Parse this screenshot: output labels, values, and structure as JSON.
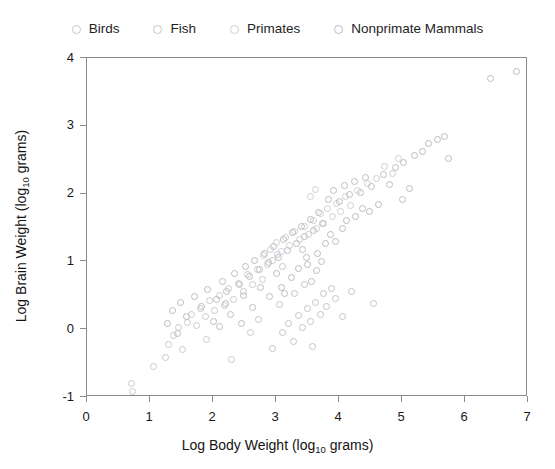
{
  "legend": {
    "position": "top",
    "items": [
      {
        "label": "Birds",
        "color": "#c9c9cf",
        "marker": "open-circle"
      },
      {
        "label": "Fish",
        "color": "#c4c4ca",
        "marker": "open-circle"
      },
      {
        "label": "Primates",
        "color": "#cfcfd5",
        "marker": "open-circle"
      },
      {
        "label": "Nonprimate Mammals",
        "color": "#bcbcc2",
        "marker": "open-circle"
      }
    ]
  },
  "axes": {
    "x": {
      "title_prefix": "Log Body Weight (log",
      "title_sub": "10",
      "title_suffix": " grams)",
      "ticks": [
        "0",
        "1",
        "2",
        "3",
        "4",
        "5",
        "6",
        "7"
      ]
    },
    "y": {
      "title_prefix": "Log Brain Weight (log",
      "title_sub": "10",
      "title_suffix": " grams)",
      "ticks": [
        "4",
        "3",
        "2",
        "1",
        "0",
        "-1"
      ]
    }
  },
  "chart_data": {
    "type": "scatter",
    "title": "",
    "xlabel": "Log Body Weight (log10 grams)",
    "ylabel": "Log Brain Weight (log10 grams)",
    "xlim": [
      0,
      7
    ],
    "ylim": [
      -1,
      4
    ],
    "xticks": [
      0,
      1,
      2,
      3,
      4,
      5,
      6,
      7
    ],
    "yticks": [
      -1,
      0,
      1,
      2,
      3,
      4
    ],
    "grid": false,
    "legend_position": "top",
    "marker_style": "open-circle",
    "marker_size_px": 7,
    "series": [
      {
        "name": "Birds",
        "color": "#c9c9cf",
        "points": [
          [
            0.7,
            -0.8
          ],
          [
            0.72,
            -0.92
          ],
          [
            1.05,
            -0.55
          ],
          [
            1.3,
            -0.22
          ],
          [
            1.38,
            -0.1
          ],
          [
            1.45,
            0.02
          ],
          [
            1.52,
            -0.3
          ],
          [
            1.6,
            0.1
          ],
          [
            1.66,
            0.22
          ],
          [
            1.74,
            0.05
          ],
          [
            1.8,
            0.3
          ],
          [
            1.88,
            0.18
          ],
          [
            1.95,
            0.42
          ],
          [
            2.02,
            0.28
          ],
          [
            2.1,
            0.5
          ],
          [
            2.18,
            0.35
          ],
          [
            2.25,
            0.6
          ],
          [
            2.32,
            0.44
          ],
          [
            2.4,
            0.68
          ],
          [
            2.48,
            0.55
          ],
          [
            2.55,
            0.8
          ],
          [
            2.62,
            0.66
          ],
          [
            2.7,
            0.88
          ],
          [
            2.78,
            0.74
          ],
          [
            2.3,
            -0.45
          ],
          [
            2.6,
            -0.05
          ],
          [
            2.86,
            0.95
          ],
          [
            2.94,
            1.02
          ],
          [
            3.02,
            1.1
          ],
          [
            3.1,
            0.92
          ],
          [
            1.25,
            -0.42
          ],
          [
            1.9,
            -0.15
          ]
        ]
      },
      {
        "name": "Fish",
        "color": "#c4c4ca",
        "points": [
          [
            2.95,
            -0.28
          ],
          [
            3.1,
            -0.05
          ],
          [
            3.2,
            0.08
          ],
          [
            3.28,
            -0.18
          ],
          [
            3.35,
            0.2
          ],
          [
            3.42,
            0.02
          ],
          [
            3.5,
            0.3
          ],
          [
            3.55,
            0.12
          ],
          [
            3.58,
            -0.25
          ],
          [
            3.62,
            0.4
          ],
          [
            3.7,
            0.22
          ],
          [
            3.75,
            0.52
          ],
          [
            3.8,
            0.34
          ],
          [
            3.88,
            0.6
          ],
          [
            3.95,
            0.45
          ],
          [
            4.05,
            0.18
          ],
          [
            4.2,
            0.55
          ],
          [
            4.55,
            0.38
          ],
          [
            3.45,
            0.66
          ],
          [
            3.3,
            0.52
          ],
          [
            2.72,
            0.15
          ],
          [
            3.05,
            0.36
          ]
        ]
      },
      {
        "name": "Primates",
        "color": "#cfcfd5",
        "points": [
          [
            2.8,
            1.08
          ],
          [
            2.92,
            1.18
          ],
          [
            3.0,
            1.28
          ],
          [
            3.08,
            1.15
          ],
          [
            3.15,
            1.35
          ],
          [
            3.22,
            1.24
          ],
          [
            3.3,
            1.44
          ],
          [
            3.38,
            1.32
          ],
          [
            3.45,
            1.52
          ],
          [
            3.52,
            1.4
          ],
          [
            3.6,
            1.6
          ],
          [
            3.65,
            1.48
          ],
          [
            3.7,
            1.7
          ],
          [
            3.76,
            1.56
          ],
          [
            3.82,
            1.78
          ],
          [
            3.9,
            1.66
          ],
          [
            3.96,
            1.86
          ],
          [
            4.02,
            1.74
          ],
          [
            4.1,
            1.95
          ],
          [
            4.18,
            1.82
          ],
          [
            4.3,
            2.05
          ],
          [
            4.45,
            2.15
          ],
          [
            4.6,
            2.22
          ],
          [
            4.85,
            2.3
          ],
          [
            3.55,
            1.95
          ],
          [
            3.62,
            2.06
          ],
          [
            4.72,
            2.4
          ],
          [
            4.95,
            2.52
          ]
        ]
      },
      {
        "name": "Nonprimate Mammals",
        "color": "#bcbcc2",
        "points": [
          [
            1.35,
            0.28
          ],
          [
            1.48,
            0.4
          ],
          [
            1.58,
            0.18
          ],
          [
            1.7,
            0.48
          ],
          [
            1.82,
            0.34
          ],
          [
            1.92,
            0.58
          ],
          [
            2.05,
            0.44
          ],
          [
            2.15,
            0.7
          ],
          [
            2.22,
            0.56
          ],
          [
            2.34,
            0.82
          ],
          [
            2.42,
            0.66
          ],
          [
            2.52,
            0.92
          ],
          [
            2.58,
            0.78
          ],
          [
            2.66,
            1.02
          ],
          [
            2.74,
            0.88
          ],
          [
            2.82,
            1.12
          ],
          [
            2.88,
            0.98
          ],
          [
            2.96,
            1.22
          ],
          [
            3.04,
            1.06
          ],
          [
            3.12,
            1.32
          ],
          [
            3.18,
            1.16
          ],
          [
            3.26,
            1.42
          ],
          [
            3.32,
            1.26
          ],
          [
            3.4,
            1.52
          ],
          [
            3.46,
            1.36
          ],
          [
            3.54,
            1.62
          ],
          [
            3.6,
            1.46
          ],
          [
            3.68,
            1.72
          ],
          [
            3.74,
            1.56
          ],
          [
            3.84,
            1.92
          ],
          [
            3.92,
            2.04
          ],
          [
            4.0,
            1.88
          ],
          [
            4.08,
            2.12
          ],
          [
            4.16,
            1.98
          ],
          [
            4.24,
            2.18
          ],
          [
            4.34,
            2.02
          ],
          [
            4.42,
            2.24
          ],
          [
            4.52,
            2.1
          ],
          [
            4.62,
            1.84
          ],
          [
            4.7,
            2.28
          ],
          [
            4.8,
            2.14
          ],
          [
            4.9,
            2.38
          ],
          [
            5.02,
            2.46
          ],
          [
            5.12,
            2.08
          ],
          [
            5.2,
            2.56
          ],
          [
            5.32,
            2.62
          ],
          [
            5.42,
            2.74
          ],
          [
            5.56,
            2.8
          ],
          [
            5.68,
            2.84
          ],
          [
            5.74,
            2.52
          ],
          [
            6.4,
            3.7
          ],
          [
            6.82,
            3.8
          ],
          [
            2.1,
            0.04
          ],
          [
            2.28,
            0.22
          ],
          [
            2.45,
            0.08
          ],
          [
            2.62,
            0.32
          ],
          [
            2.9,
            0.48
          ],
          [
            3.08,
            0.62
          ],
          [
            3.24,
            0.76
          ],
          [
            3.36,
            0.9
          ],
          [
            3.48,
            1.06
          ],
          [
            3.56,
            0.7
          ],
          [
            3.66,
            1.12
          ],
          [
            3.78,
            1.26
          ],
          [
            1.28,
            0.08
          ],
          [
            1.44,
            -0.06
          ],
          [
            2.0,
            0.12
          ],
          [
            2.2,
            0.38
          ],
          [
            3.0,
            0.82
          ],
          [
            3.14,
            0.52
          ],
          [
            3.42,
            1.18
          ],
          [
            3.5,
            0.96
          ],
          [
            4.06,
            1.48
          ],
          [
            4.26,
            1.66
          ],
          [
            4.48,
            1.74
          ],
          [
            5.0,
            1.92
          ],
          [
            3.86,
            1.4
          ],
          [
            3.94,
            1.3
          ],
          [
            2.76,
            0.62
          ],
          [
            2.48,
            0.5
          ],
          [
            3.64,
            0.86
          ],
          [
            3.72,
            1.0
          ],
          [
            4.12,
            1.6
          ],
          [
            4.38,
            1.78
          ]
        ]
      }
    ]
  }
}
